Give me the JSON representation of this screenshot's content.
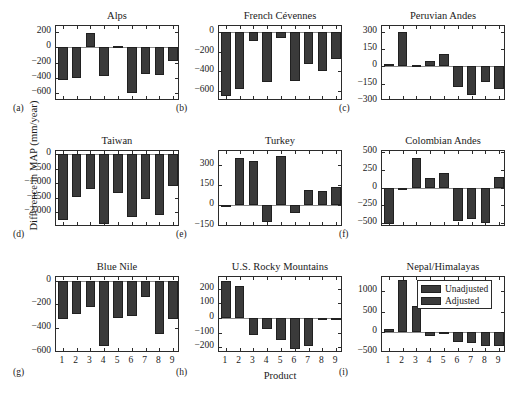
{
  "figure": {
    "ylabel": "Difference in MAP (mm/year)",
    "xlabel": "Product",
    "legend": {
      "items": [
        {
          "label": "Unadjusted",
          "color": "#3a3a3a"
        },
        {
          "label": "Adjusted",
          "color": "#3a3a3a"
        }
      ]
    }
  },
  "chart_data": [
    {
      "type": "bar",
      "panel": "a",
      "title": "Alps",
      "xlabel": "",
      "ylabel": "Difference in MAP (mm/year)",
      "categories": [
        "1",
        "2",
        "3",
        "4",
        "5",
        "6",
        "7",
        "8",
        "9"
      ],
      "values": [
        -430,
        -400,
        185,
        -375,
        20,
        -600,
        -345,
        -355,
        -175
      ],
      "ylim": [
        -700,
        280
      ],
      "yticks": [
        200,
        0,
        -200,
        -400,
        -600
      ],
      "ytick_labels": [
        "200",
        "0",
        "-200",
        "-400",
        "-600"
      ],
      "xtick_labels": [
        "",
        "",
        "",
        "",
        "",
        "",
        "",
        "",
        ""
      ],
      "grid": false
    },
    {
      "type": "bar",
      "panel": "b",
      "title": "French Cévennes",
      "xlabel": "",
      "ylabel": "",
      "categories": [
        "1",
        "2",
        "3",
        "4",
        "5",
        "6",
        "7",
        "8",
        "9"
      ],
      "values": [
        -645,
        -580,
        -95,
        -505,
        -65,
        -495,
        -325,
        -395,
        -270
      ],
      "ylim": [
        -700,
        60
      ],
      "yticks": [
        0,
        -200,
        -400,
        -600
      ],
      "ytick_labels": [
        "0",
        "-200",
        "-400",
        "-600"
      ],
      "xtick_labels": [
        "",
        "",
        "",
        "",
        "",
        "",
        "",
        "",
        ""
      ],
      "grid": false
    },
    {
      "type": "bar",
      "panel": "c",
      "title": "Peruvian Andes",
      "xlabel": "",
      "ylabel": "",
      "categories": [
        "1",
        "2",
        "3",
        "4",
        "5",
        "6",
        "7",
        "8",
        "9"
      ],
      "values": [
        20,
        300,
        8,
        50,
        105,
        -180,
        -250,
        -135,
        -195
      ],
      "ylim": [
        -300,
        350
      ],
      "yticks": [
        300,
        150,
        0,
        -150,
        -300
      ],
      "ytick_labels": [
        "300",
        "150",
        "0",
        "-150",
        "-300"
      ],
      "xtick_labels": [
        "",
        "",
        "",
        "",
        "",
        "",
        "",
        "",
        ""
      ],
      "grid": false
    },
    {
      "type": "bar",
      "panel": "d",
      "title": "Taiwan",
      "xlabel": "",
      "ylabel": "Difference in MAP (mm/year)",
      "categories": [
        "1",
        "2",
        "3",
        "4",
        "5",
        "6",
        "7",
        "8",
        "9"
      ],
      "values": [
        -2260,
        -1480,
        -1190,
        -2410,
        -1340,
        -2140,
        -1530,
        -2080,
        -1100
      ],
      "ylim": [
        -2500,
        120
      ],
      "yticks": [
        0,
        -500,
        -1000,
        -1500,
        -2000
      ],
      "ytick_labels": [
        "0",
        "-500",
        "-1.000",
        "-1500",
        "-2,000"
      ],
      "xtick_labels": [
        "",
        "",
        "",
        "",
        "",
        "",
        "",
        "",
        ""
      ],
      "grid": false
    },
    {
      "type": "bar",
      "panel": "e",
      "title": "Turkey",
      "xlabel": "",
      "ylabel": "",
      "categories": [
        "1",
        "2",
        "3",
        "4",
        "5",
        "6",
        "7",
        "8",
        "9"
      ],
      "values": [
        -8,
        345,
        325,
        -120,
        360,
        -55,
        115,
        105,
        135
      ],
      "ylim": [
        -160,
        400
      ],
      "yticks": [
        300,
        150,
        0,
        -150
      ],
      "ytick_labels": [
        "300",
        "150",
        "0",
        "-150"
      ],
      "xtick_labels": [
        "",
        "",
        "",
        "",
        "",
        "",
        "",
        "",
        ""
      ],
      "grid": false
    },
    {
      "type": "bar",
      "panel": "f",
      "title": "Colombian Andes",
      "xlabel": "",
      "ylabel": "",
      "categories": [
        "1",
        "2",
        "3",
        "4",
        "5",
        "6",
        "7",
        "8",
        "9"
      ],
      "values": [
        -520,
        -20,
        415,
        135,
        210,
        -470,
        -440,
        -510,
        145
      ],
      "ylim": [
        -560,
        520
      ],
      "yticks": [
        500,
        250,
        0,
        -250,
        -500
      ],
      "ytick_labels": [
        "500",
        "250",
        "0",
        "-250",
        "-500"
      ],
      "xtick_labels": [
        "",
        "",
        "",
        "",
        "",
        "",
        "",
        "",
        ""
      ],
      "grid": false
    },
    {
      "type": "bar",
      "panel": "g",
      "title": "Blue Nile",
      "xlabel": "",
      "ylabel": "Difference in MAP (mm/year)",
      "categories": [
        "1",
        "2",
        "3",
        "4",
        "5",
        "6",
        "7",
        "8",
        "9"
      ],
      "values": [
        -325,
        -285,
        -220,
        -555,
        -315,
        -295,
        -140,
        -450,
        -325
      ],
      "ylim": [
        -610,
        30
      ],
      "yticks": [
        0,
        -200,
        -400,
        -600
      ],
      "ytick_labels": [
        "0",
        "-200",
        "-400",
        "-600"
      ],
      "xtick_labels": [
        "1",
        "2",
        "3",
        "4",
        "5",
        "6",
        "7",
        "8",
        "9"
      ],
      "grid": false
    },
    {
      "type": "bar",
      "panel": "h",
      "title": "U.S. Rocky Mountains",
      "xlabel": "Product",
      "ylabel": "",
      "categories": [
        "1",
        "2",
        "3",
        "4",
        "5",
        "6",
        "7",
        "8",
        "9"
      ],
      "values": [
        250,
        220,
        -115,
        -75,
        -150,
        -210,
        -195,
        -15,
        -10
      ],
      "ylim": [
        -240,
        280
      ],
      "yticks": [
        200,
        100,
        0,
        -100,
        -200
      ],
      "ytick_labels": [
        "200",
        "100",
        "0",
        "-100",
        "-200"
      ],
      "xtick_labels": [
        "1",
        "2",
        "3",
        "4",
        "5",
        "6",
        "7",
        "8",
        "9"
      ],
      "grid": false
    },
    {
      "type": "bar",
      "panel": "i",
      "title": "Nepal/Himalayas",
      "xlabel": "",
      "ylabel": "",
      "categories": [
        "1",
        "2",
        "3",
        "4",
        "5",
        "6",
        "7",
        "8",
        "9"
      ],
      "values": [
        60,
        1270,
        640,
        -90,
        -20,
        -250,
        -270,
        -350,
        -345
      ],
      "ylim": [
        -520,
        1350
      ],
      "yticks": [
        1000,
        500,
        0,
        -500
      ],
      "ytick_labels": [
        "1000",
        "500",
        "0",
        "-500"
      ],
      "xtick_labels": [
        "1",
        "2",
        "3",
        "4",
        "5",
        "6",
        "7",
        "8",
        "9"
      ],
      "grid": false
    }
  ],
  "panel_letters": [
    "(a)",
    "(b)",
    "(c)",
    "(d)",
    "(e)",
    "(f)",
    "(g)",
    "(h)",
    "(i)"
  ]
}
